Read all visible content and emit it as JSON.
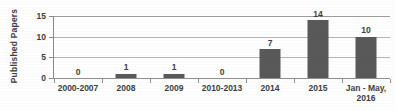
{
  "chart_data": {
    "type": "bar",
    "title": "",
    "xlabel": "",
    "ylabel": "Published Papers",
    "categories": [
      "2000-2007",
      "2008",
      "2009",
      "2010-2013",
      "2014",
      "2015",
      "Jan - May,\n2016"
    ],
    "values": [
      0,
      1,
      1,
      0,
      7,
      14,
      10
    ],
    "data_labels": [
      "0",
      "1",
      "1",
      "0",
      "7",
      "14",
      "10"
    ],
    "ylim": [
      0,
      15
    ],
    "yticks": [
      0,
      5,
      10,
      15
    ],
    "ytick_labels": [
      "0",
      "5",
      "10",
      "15"
    ],
    "grid": true,
    "legend": "none",
    "bar_color": "#595959",
    "gridline_color": "#b6b6b6",
    "axis_color": "#8a8a8a",
    "text_color": "#3d3d3d",
    "background_color": "#ffffff"
  },
  "axis": {
    "y_title": "Published Papers"
  }
}
